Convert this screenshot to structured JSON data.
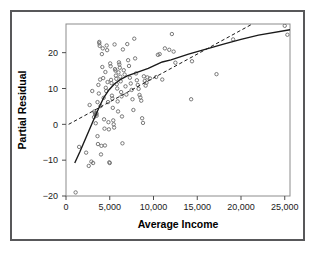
{
  "figure": {
    "background_color": "#ffffff",
    "border_color": "#58585a",
    "frame_color": "#8c8c8c",
    "marker_color": "#6b6b6b",
    "line_color": "#1a1a1a"
  },
  "chart_data": {
    "type": "scatter",
    "title": "",
    "xlabel": "Average Income",
    "ylabel": "Partial Residual",
    "xlim": [
      0,
      25600
    ],
    "ylim": [
      -20,
      28
    ],
    "grid": false,
    "legend": null,
    "xticks": [
      0,
      5000,
      10000,
      15000,
      20000,
      25000
    ],
    "xticklabels": [
      "0",
      "5,000",
      "10,000",
      "15,000",
      "20,000",
      "25,000"
    ],
    "yticks": [
      -20,
      -10,
      0,
      10,
      20
    ],
    "yticklabels": [
      "−20",
      "−10",
      "0",
      "10",
      "20"
    ],
    "marker": "open-circle",
    "points": [
      [
        1100,
        -19.0
      ],
      [
        1500,
        -6.3
      ],
      [
        2300,
        -7.9
      ],
      [
        2600,
        -11.6
      ],
      [
        2700,
        5.4
      ],
      [
        2900,
        -10.4
      ],
      [
        3000,
        9.3
      ],
      [
        3100,
        -10.8
      ],
      [
        3200,
        2.0
      ],
      [
        3250,
        3.6
      ],
      [
        3300,
        3.2
      ],
      [
        3350,
        2.6
      ],
      [
        3400,
        2.9
      ],
      [
        3400,
        0.3
      ],
      [
        3500,
        3.0
      ],
      [
        3500,
        2.4
      ],
      [
        3600,
        6.2
      ],
      [
        3600,
        -3.3
      ],
      [
        3650,
        -5.5
      ],
      [
        3700,
        11.0
      ],
      [
        3750,
        8.6
      ],
      [
        3800,
        22.6
      ],
      [
        3800,
        23.0
      ],
      [
        3850,
        21.9
      ],
      [
        3900,
        12.5
      ],
      [
        3950,
        5.1
      ],
      [
        4000,
        -8.4
      ],
      [
        4050,
        -6.0
      ],
      [
        4100,
        19.6
      ],
      [
        4150,
        16.0
      ],
      [
        4200,
        21.2
      ],
      [
        4250,
        12.9
      ],
      [
        4300,
        7.4
      ],
      [
        4350,
        1.4
      ],
      [
        4400,
        -1.2
      ],
      [
        4450,
        -5.9
      ],
      [
        4500,
        14.6
      ],
      [
        4550,
        10.2
      ],
      [
        4600,
        9.3
      ],
      [
        4650,
        22.0
      ],
      [
        4700,
        20.7
      ],
      [
        4750,
        11.8
      ],
      [
        4800,
        6.2
      ],
      [
        4850,
        0.6
      ],
      [
        4900,
        -1.4
      ],
      [
        4950,
        -10.6
      ],
      [
        5000,
        -10.8
      ],
      [
        5050,
        17.0
      ],
      [
        5100,
        16.2
      ],
      [
        5150,
        12.4
      ],
      [
        5200,
        11.5
      ],
      [
        5250,
        8.0
      ],
      [
        5300,
        7.2
      ],
      [
        5350,
        4.6
      ],
      [
        5400,
        1.1
      ],
      [
        5450,
        0.0
      ],
      [
        5500,
        -0.9
      ],
      [
        5550,
        22.3
      ],
      [
        5600,
        15.4
      ],
      [
        5650,
        15.0
      ],
      [
        5700,
        13.6
      ],
      [
        5750,
        12.7
      ],
      [
        5800,
        11.2
      ],
      [
        5850,
        10.0
      ],
      [
        5900,
        6.4
      ],
      [
        5950,
        3.6
      ],
      [
        6000,
        14.5
      ],
      [
        6050,
        17.3
      ],
      [
        6100,
        16.7
      ],
      [
        6150,
        15.8
      ],
      [
        6200,
        13.3
      ],
      [
        6250,
        12.0
      ],
      [
        6300,
        9.0
      ],
      [
        6350,
        7.8
      ],
      [
        6400,
        2.2
      ],
      [
        6450,
        -5.3
      ],
      [
        6500,
        20.9
      ],
      [
        6600,
        15.1
      ],
      [
        6700,
        13.9
      ],
      [
        6800,
        10.6
      ],
      [
        6900,
        8.3
      ],
      [
        7000,
        22.4
      ],
      [
        7100,
        17.9
      ],
      [
        7200,
        16.3
      ],
      [
        7300,
        13.0
      ],
      [
        7400,
        11.4
      ],
      [
        7500,
        9.6
      ],
      [
        7600,
        7.0
      ],
      [
        7700,
        4.0
      ],
      [
        7800,
        23.9
      ],
      [
        7900,
        18.4
      ],
      [
        8000,
        14.2
      ],
      [
        8100,
        12.3
      ],
      [
        8200,
        11.0
      ],
      [
        8300,
        9.9
      ],
      [
        8400,
        8.2
      ],
      [
        8500,
        7.5
      ],
      [
        8600,
        6.6
      ],
      [
        8700,
        1.7
      ],
      [
        8800,
        0.4
      ],
      [
        8900,
        13.4
      ],
      [
        9000,
        12.1
      ],
      [
        9100,
        10.8
      ],
      [
        9200,
        11.6
      ],
      [
        9300,
        13.1
      ],
      [
        9600,
        12.8
      ],
      [
        10300,
        13.2
      ],
      [
        10500,
        19.4
      ],
      [
        10700,
        19.6
      ],
      [
        11000,
        12.5
      ],
      [
        11300,
        21.2
      ],
      [
        11800,
        20.8
      ],
      [
        12100,
        25.2
      ],
      [
        12300,
        20.3
      ],
      [
        12500,
        17.2
      ],
      [
        14300,
        7.0
      ],
      [
        14400,
        17.6
      ],
      [
        17200,
        14.0
      ],
      [
        19100,
        23.7
      ],
      [
        25000,
        27.5
      ],
      [
        25300,
        25.0
      ]
    ],
    "fitted_curves": [
      {
        "name": "smooth-fit",
        "style": "solid",
        "points": [
          [
            1000,
            -10.8
          ],
          [
            1600,
            -7.6
          ],
          [
            2300,
            -3.6
          ],
          [
            3000,
            0.4
          ],
          [
            3700,
            4.3
          ],
          [
            4300,
            7.4
          ],
          [
            4900,
            9.6
          ],
          [
            5500,
            11.2
          ],
          [
            6200,
            12.5
          ],
          [
            7000,
            13.5
          ],
          [
            7800,
            14.2
          ],
          [
            8600,
            14.9
          ],
          [
            9400,
            15.6
          ],
          [
            10200,
            16.5
          ],
          [
            11000,
            17.4
          ],
          [
            12000,
            18.0
          ],
          [
            14000,
            19.6
          ],
          [
            16000,
            21.0
          ],
          [
            18000,
            22.4
          ],
          [
            20000,
            23.7
          ],
          [
            22000,
            24.9
          ],
          [
            25600,
            26.4
          ]
        ]
      },
      {
        "name": "linear-fit",
        "style": "dashed",
        "points": [
          [
            300,
            0.0
          ],
          [
            21300,
            28.0
          ]
        ]
      }
    ]
  }
}
